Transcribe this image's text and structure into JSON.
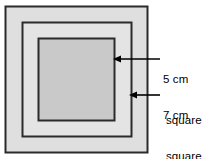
{
  "figure": {
    "background_color": "#ffffff",
    "stroke_color": "#2b2b2b",
    "squares": [
      {
        "name": "outer-square",
        "label": "7 cm square",
        "size_cm": 7,
        "fill_color": "#dfdfdf",
        "x": 5,
        "y": 6,
        "side": 142
      },
      {
        "name": "middle-square",
        "label": "middle square",
        "fill_color": "#e3e3e3",
        "x": 22,
        "y": 22,
        "side": 109
      },
      {
        "name": "inner-square",
        "label": "5 cm square",
        "size_cm": 5,
        "fill_color": "#c9c9c9",
        "x": 38,
        "y": 38,
        "side": 76
      }
    ]
  },
  "annotations": [
    {
      "name": "inner-square-callout",
      "line1": "5 cm",
      "line2": "square",
      "arrow_tip_x": 115,
      "arrow_tip_y": 59,
      "arrow_tail_x": 160,
      "arrow_tail_y": 59,
      "text_x": 163,
      "text_y": 47
    },
    {
      "name": "outer-square-callout",
      "line1": "7 cm",
      "line2": "square",
      "arrow_tip_x": 131,
      "arrow_tip_y": 95,
      "arrow_tail_x": 160,
      "arrow_tail_y": 95,
      "text_x": 163,
      "text_y": 83
    }
  ]
}
